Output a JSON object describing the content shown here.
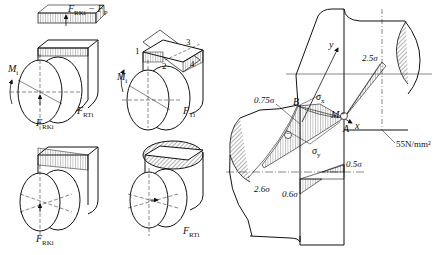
{
  "figure": {
    "panels": [
      {
        "id": "panel-a",
        "labels": {
          "top_force_main": "F",
          "top_force_sub": "RKi",
          "top_force_minus": " − F",
          "top_force_minus_sub": "P",
          "moment": "M",
          "moment_sub": "i",
          "side_force": "F",
          "side_force_sub": "RTi",
          "bottom_force": "F",
          "bottom_force_sub": "RKi"
        }
      },
      {
        "id": "panel-b",
        "labels": {
          "points": [
            "1",
            "2",
            "3",
            "4"
          ],
          "moment": "M",
          "moment_sub": "i",
          "side_force": "F",
          "side_force_sub": "Ti"
        }
      },
      {
        "id": "panel-c",
        "labels": {
          "bottom_force": "F",
          "bottom_force_sub": "RKi"
        }
      },
      {
        "id": "panel-d",
        "labels": {
          "side_force": "F",
          "side_force_sub": "RTi"
        }
      }
    ],
    "stress_diagram": {
      "axes": {
        "x": "x",
        "y": "y"
      },
      "points": {
        "B": "B",
        "M": "M",
        "A": "A"
      },
      "stresses": {
        "sigma_x": "σ",
        "sigma_x_sub": "x",
        "sigma_y": "σ",
        "sigma_y_sub": "y"
      },
      "values": {
        "v1": "0.75σ",
        "v2": "2.5σ",
        "v3": "2.6σ",
        "v4": "0.6σ",
        "v5": "0.5σ",
        "v6": "55N/mm²"
      },
      "signs": {
        "plus": "+",
        "minus": "−"
      }
    }
  }
}
